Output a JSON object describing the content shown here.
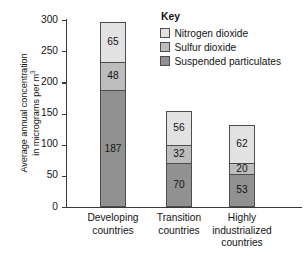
{
  "chart_data": {
    "type": "bar",
    "subtype": "stacked-bar",
    "title": "",
    "xlabel": "",
    "ylabel": "Average annual concentration in micrograms per m³",
    "ylabel_lines": [
      "Average annual concentration",
      "in micrograms per m"
    ],
    "ylabel_superscript": "3",
    "ylim": [
      0,
      300
    ],
    "ytick_step": 50,
    "yticks": [
      300,
      250,
      200,
      150,
      100,
      50,
      0
    ],
    "grid": false,
    "legend_position": "top-right",
    "legend_title": "Key",
    "categories": [
      "Developing countries",
      "Transition countries",
      "Highly industrialized countries"
    ],
    "category_lines": [
      [
        "Developing",
        "countries"
      ],
      [
        "Transition",
        "countries"
      ],
      [
        "Highly",
        "industrialized",
        "countries"
      ]
    ],
    "series": [
      {
        "name": "Suspended particulates",
        "color": "#919191",
        "values": [
          187,
          70,
          53
        ]
      },
      {
        "name": "Sulfur dioxide",
        "color": "#bdbdbd",
        "values": [
          48,
          32,
          20
        ]
      },
      {
        "name": "Nitrogen dioxide",
        "color": "#e2e2e2",
        "values": [
          65,
          56,
          62
        ]
      }
    ],
    "totals": [
      300,
      158,
      135
    ],
    "colors": {
      "axis": "#3a3a3a",
      "segment_border": "#4d4d4d",
      "text": "#141414",
      "background": "#ffffff"
    }
  },
  "axis": {
    "ticks": [
      {
        "value": "300"
      },
      {
        "value": "250"
      },
      {
        "value": "200"
      },
      {
        "value": "150"
      },
      {
        "value": "100"
      },
      {
        "value": "50"
      },
      {
        "value": "0"
      }
    ]
  },
  "legend": {
    "title": "Key",
    "items": [
      {
        "label": "Nitrogen dioxide",
        "color": "#e2e2e2"
      },
      {
        "label": "Sulfur dioxide",
        "color": "#bdbdbd"
      },
      {
        "label": "Suspended particulates",
        "color": "#919191"
      }
    ]
  }
}
